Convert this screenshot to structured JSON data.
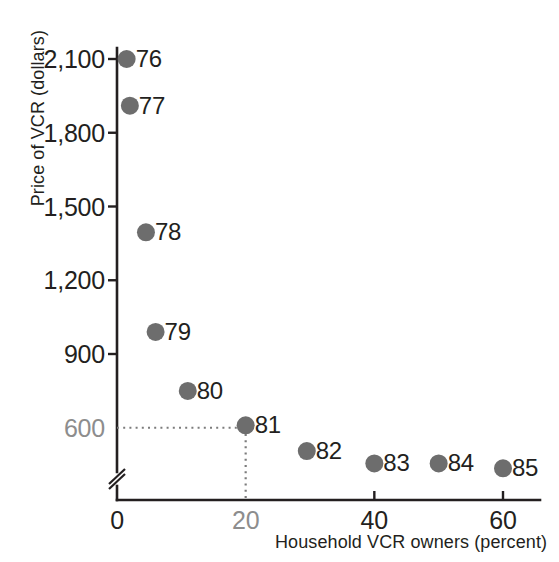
{
  "chart_data": {
    "type": "scatter",
    "title": "",
    "xlabel": "Household VCR owners (percent)",
    "ylabel": "Price of VCR (dollars)",
    "xlim": [
      0,
      65
    ],
    "ylim": [
      450,
      2200
    ],
    "grid": false,
    "legend": "none",
    "axis_break_y": true,
    "point_color": "#6d6d6d",
    "highlight_color": "#8d8d8d",
    "axis_color": "#231f20",
    "x_ticks": [
      {
        "value": 0,
        "label": "0",
        "highlight": false
      },
      {
        "value": 20,
        "label": "20",
        "highlight": true
      },
      {
        "value": 40,
        "label": "40",
        "highlight": false
      },
      {
        "value": 60,
        "label": "60",
        "highlight": false
      }
    ],
    "y_ticks": [
      {
        "value": 2100,
        "label": "2,100",
        "highlight": false
      },
      {
        "value": 1800,
        "label": "1,800",
        "highlight": false
      },
      {
        "value": 1500,
        "label": "1,500",
        "highlight": false
      },
      {
        "value": 1200,
        "label": "1,200",
        "highlight": false
      },
      {
        "value": 900,
        "label": "900",
        "highlight": false
      },
      {
        "value": 600,
        "label": "600",
        "highlight": true
      }
    ],
    "points": [
      {
        "label": "76",
        "x": 1.5,
        "y": 2100
      },
      {
        "label": "77",
        "x": 2.0,
        "y": 1910
      },
      {
        "label": "78",
        "x": 4.5,
        "y": 1395
      },
      {
        "label": "79",
        "x": 6.0,
        "y": 990
      },
      {
        "label": "80",
        "x": 11.0,
        "y": 750
      },
      {
        "label": "81",
        "x": 20.0,
        "y": 610
      },
      {
        "label": "82",
        "x": 29.5,
        "y": 505
      },
      {
        "label": "83",
        "x": 40.0,
        "y": 455
      },
      {
        "label": "84",
        "x": 50.0,
        "y": 455
      },
      {
        "label": "85",
        "x": 60.0,
        "y": 435
      }
    ],
    "annotations": [
      {
        "name": "guide-600-to-81",
        "description": "dotted horizontal guide from y-axis at 600 to point 81",
        "from": {
          "x": 0,
          "y": 600
        },
        "to": {
          "x": 20,
          "y": 600
        }
      },
      {
        "name": "guide-81-to-20",
        "description": "dotted vertical guide from point 81 down to x-axis at 20",
        "from": {
          "x": 20,
          "y": 600
        },
        "to": {
          "x": 20,
          "y": 450
        }
      }
    ]
  }
}
